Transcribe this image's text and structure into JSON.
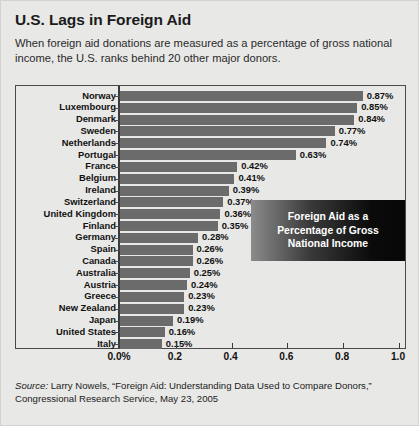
{
  "header": {
    "title": "U.S. Lags in Foreign Aid",
    "subtitle": "When foreign aid donations are measured as a percentage of gross national income, the U.S. ranks behind 20 other major donors."
  },
  "callout": {
    "line1": "Foreign Aid as a",
    "line2": "Percentage of Gross",
    "line3": "National Income"
  },
  "source": {
    "label": "Source:",
    "text": " Larry Nowels, “Foreign Aid: Understanding Data Used to Compare Donors,” Congressional Research Service, May 23, 2005"
  },
  "colors": {
    "bar": "#6b6b6b",
    "background": "#e8e8e6",
    "frame": "#4a4a4a",
    "callout_text": "#ffffff"
  },
  "chart_data": {
    "type": "bar",
    "orientation": "horizontal",
    "title": "U.S. Lags in Foreign Aid",
    "subtitle": "When foreign aid donations are measured as a percentage of gross national income, the U.S. ranks behind 20 other major donors.",
    "xlabel": "",
    "ylabel": "",
    "xlim": [
      0,
      1.0
    ],
    "grid": false,
    "legend": null,
    "annotation": "Foreign Aid as a Percentage of Gross National Income",
    "tick_labels": [
      "0.0%",
      "0.2",
      "0.4",
      "0.6",
      "0.8",
      "1.0"
    ],
    "tick_values": [
      0.0,
      0.2,
      0.4,
      0.6,
      0.8,
      1.0
    ],
    "categories": [
      "Norway",
      "Luxembourg",
      "Denmark",
      "Sweden",
      "Netherlands",
      "Portugal",
      "France",
      "Belgium",
      "Ireland",
      "Switzerland",
      "United Kingdom",
      "Finland",
      "Germany",
      "Spain",
      "Canada",
      "Australia",
      "Austria",
      "Greece",
      "New Zealand",
      "Japan",
      "United States",
      "Italy"
    ],
    "values": [
      0.87,
      0.85,
      0.84,
      0.77,
      0.74,
      0.63,
      0.42,
      0.41,
      0.39,
      0.37,
      0.36,
      0.35,
      0.28,
      0.26,
      0.26,
      0.25,
      0.24,
      0.23,
      0.23,
      0.19,
      0.16,
      0.15
    ],
    "value_labels": [
      "0.87%",
      "0.85%",
      "0.84%",
      "0.77%",
      "0.74%",
      "0.63%",
      "0.42%",
      "0.41%",
      "0.39%",
      "0.37%",
      "0.36%",
      "0.35%",
      "0.28%",
      "0.26%",
      "0.26%",
      "0.25%",
      "0.24%",
      "0.23%",
      "0.23%",
      "0.19%",
      "0.16%",
      "0.15%"
    ]
  }
}
